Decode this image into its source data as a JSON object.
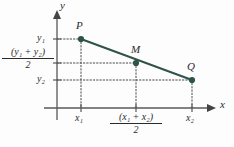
{
  "figure": {
    "colors": {
      "line": "#2d5446",
      "point": "#2d5446",
      "axis": "#585858",
      "guide": "#4a4a4a",
      "text": "#2b2b2b",
      "background": "#fdfdfd"
    },
    "axes": {
      "x_label": "x",
      "y_label": "y",
      "origin": {
        "x": 57,
        "y": 108
      },
      "x_end": 213,
      "y_top": 12
    },
    "points": [
      {
        "name": "P",
        "label": "P",
        "px": 81,
        "py": 39,
        "label_dx": -2,
        "label_dy": -16
      },
      {
        "name": "M",
        "label": "M",
        "px": 136,
        "py": 63,
        "label_dx": -1,
        "label_dy": -16
      },
      {
        "name": "Q",
        "label": "Q",
        "px": 192,
        "py": 80,
        "label_dx": -1,
        "label_dy": -16
      }
    ],
    "y_ticks": [
      {
        "name": "y1",
        "value_html": "y<sub>1</sub>",
        "py": 39
      },
      {
        "name": "y-midpoint",
        "py": 63
      },
      {
        "name": "y2",
        "value_html": "y<sub>2</sub>",
        "py": 80
      }
    ],
    "x_ticks": [
      {
        "name": "x1",
        "value_html": "x<sub>1</sub>",
        "px": 81
      },
      {
        "name": "x-midpoint",
        "px": 136
      },
      {
        "name": "x2",
        "value_html": "x<sub>2</sub>",
        "px": 192
      }
    ],
    "labels": {
      "y1": "y₁",
      "y2": "y₂",
      "x1": "x₁",
      "x2": "x₂",
      "y_axis": "y",
      "x_axis": "x",
      "point_p": "P",
      "point_m": "M",
      "point_q": "Q"
    },
    "fractions": {
      "y_midpoint": {
        "numerator": "(y₁ + y₂)",
        "denominator": "2"
      },
      "x_midpoint": {
        "numerator": "(x₁ + x₂)",
        "denominator": "2"
      }
    },
    "guides": {
      "style": "dotted",
      "horizontal": [
        {
          "name": "guide-y1-to-P",
          "from_x": 57,
          "to_x": 81,
          "y": 39
        },
        {
          "name": "guide-ym-to-M",
          "from_x": 57,
          "to_x": 136,
          "y": 63
        },
        {
          "name": "guide-y2-to-Q",
          "from_x": 57,
          "to_x": 192,
          "y": 80
        }
      ],
      "vertical": [
        {
          "name": "guide-P-to-x1",
          "x": 81,
          "from_y": 39,
          "to_y": 108
        },
        {
          "name": "guide-M-to-xm",
          "x": 136,
          "from_y": 63,
          "to_y": 108
        },
        {
          "name": "guide-Q-to-x2",
          "x": 192,
          "from_y": 80,
          "to_y": 108
        }
      ]
    },
    "segment": {
      "name": "segment-PQ",
      "x1": 81,
      "y1": 39,
      "x2": 192,
      "y2": 80
    }
  }
}
